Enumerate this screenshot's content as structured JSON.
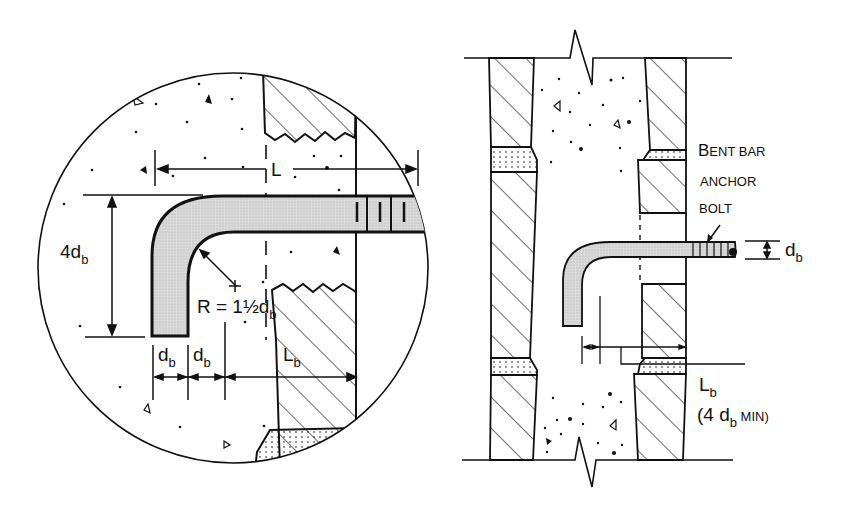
{
  "diagram": {
    "type": "engineering-detail",
    "colors": {
      "line": "#111111",
      "bolt_fill": "#d9d9d9",
      "background": "#ffffff"
    },
    "detail_view": {
      "name": "enlarged circular detail",
      "labels": {
        "L": "L",
        "four_db": {
          "main": "4d",
          "sub": "b"
        },
        "radius": {
          "main": "R = 1½d",
          "sub": "b"
        },
        "db_1": {
          "main": "d",
          "sub": "b"
        },
        "db_2": {
          "main": "d",
          "sub": "b"
        },
        "Lb": {
          "main": "L",
          "sub": "b"
        }
      }
    },
    "section_view": {
      "name": "wall section",
      "callout": {
        "line1_big": "B",
        "line1_rest": "ENT BAR",
        "line2": "ANCHOR",
        "line3": "BOLT"
      },
      "labels": {
        "db": {
          "main": "d",
          "sub": "b"
        },
        "Lb": {
          "main": "L",
          "sub": "b"
        },
        "min_note": {
          "open": "(4 d",
          "sub": "b",
          "close": " MIN)"
        }
      }
    }
  }
}
